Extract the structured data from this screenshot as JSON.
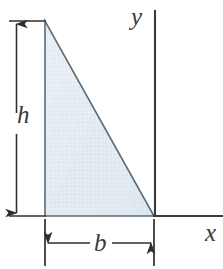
{
  "figure": {
    "kind": "geometry-diagram",
    "labels": {
      "height": "h",
      "base": "b",
      "y_axis": "y",
      "x_axis": "x"
    },
    "colors": {
      "shape_fill": "#dce7ef",
      "shape_stroke": "#5b6b78",
      "axis_line": "#3a3a3c",
      "dimension_line": "#2f2f31",
      "label_text": "#3a3a3c",
      "background": "#ffffff"
    },
    "geometry": {
      "triangle_vertices": [
        {
          "name": "apex-top-left",
          "x": 45,
          "y": 21
        },
        {
          "name": "base-left",
          "x": 45,
          "y": 216
        },
        {
          "name": "base-right-origin",
          "x": 154,
          "y": 216
        }
      ],
      "y_axis": {
        "x": 155,
        "y_top": 10,
        "y_bottom": 216
      },
      "x_axis": {
        "y": 216,
        "x_left": 154,
        "x_right": 223
      },
      "height_dimension": {
        "x": 16,
        "y_top": 21,
        "y_bottom": 216
      },
      "base_dimension": {
        "y": 243,
        "x_left": 45,
        "x_right": 154
      }
    }
  }
}
